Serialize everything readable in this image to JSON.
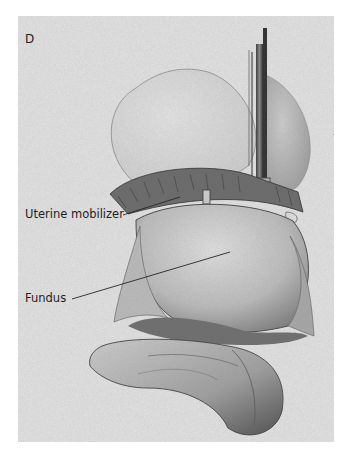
{
  "figure": {
    "panel_letter": "D",
    "labels": [
      {
        "id": "uterine-mobilizer",
        "text": "Uterine mobilizer"
      },
      {
        "id": "fundus",
        "text": "Fundus"
      }
    ],
    "colors": {
      "background": "#e4e4e4",
      "ink": "#1e1e1e",
      "tissue_light": "#d2d2d2",
      "tissue_mid": "#a8a8a8",
      "tissue_dark": "#5a5a5a"
    }
  }
}
